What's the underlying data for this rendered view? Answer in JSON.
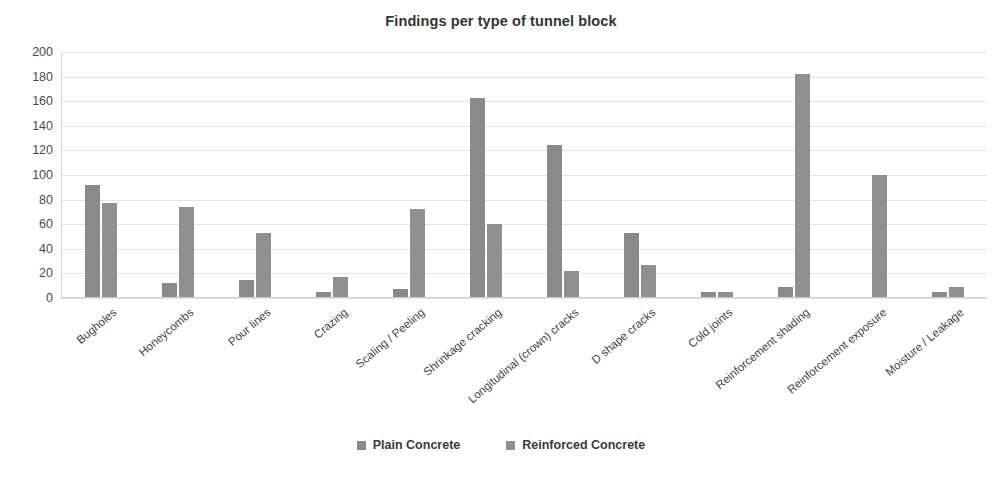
{
  "chart_data": {
    "type": "bar",
    "title": "Findings per type of tunnel block",
    "xlabel": "",
    "ylabel": "",
    "ylim": [
      0,
      200
    ],
    "yticks": [
      200,
      180,
      160,
      140,
      120,
      100,
      80,
      60,
      40,
      20,
      0
    ],
    "grid": true,
    "legend_position": "bottom",
    "categories": [
      "Bugholes",
      "Honeycombs",
      "Pour lines",
      "Crazing",
      "Scaling / Peeling",
      "Shrinkage cracking",
      "Longitudinal (crown) cracks",
      "D shape cracks",
      "Cold joints",
      "Reinforcement shading",
      "Reinforcement exposure",
      "Moisture / Leakage"
    ],
    "series": [
      {
        "name": "Plain Concrete",
        "color": "#8a8a8a",
        "values": [
          92,
          12,
          15,
          5,
          7,
          163,
          124,
          53,
          5,
          9,
          0,
          5
        ]
      },
      {
        "name": "Reinforced Concrete",
        "color": "#8f8f8f",
        "values": [
          77,
          74,
          53,
          17,
          72,
          60,
          22,
          27,
          5,
          182,
          100,
          9
        ]
      }
    ]
  },
  "legend": {
    "items": [
      {
        "label": "Plain Concrete",
        "color": "#8a8a8a"
      },
      {
        "label": "Reinforced Concrete",
        "color": "#8f8f8f"
      }
    ]
  }
}
